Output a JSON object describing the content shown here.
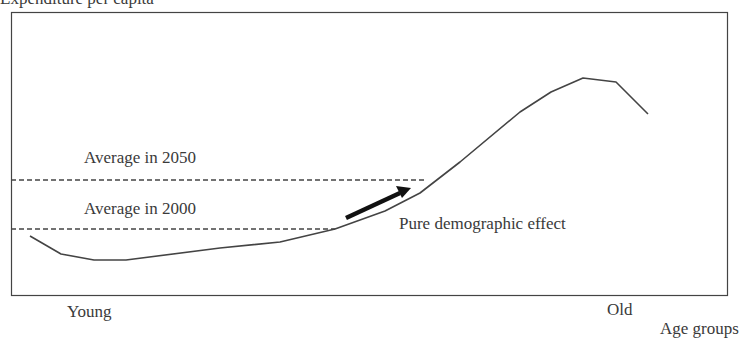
{
  "chart_data": {
    "type": "line",
    "title": "",
    "xlabel": "Age groups",
    "ylabel": "Expenditure per capita",
    "x_tick_labels": [
      "Young",
      "Old"
    ],
    "grid": false,
    "legend": null,
    "series": [
      {
        "name": "Expenditure profile by age",
        "points_px": [
          [
            30,
            236
          ],
          [
            61,
            254
          ],
          [
            94,
            260
          ],
          [
            126,
            260
          ],
          [
            220,
            248
          ],
          [
            280,
            242
          ],
          [
            335,
            229
          ],
          [
            385,
            211
          ],
          [
            420,
            193
          ],
          [
            460,
            162
          ],
          [
            520,
            112
          ],
          [
            551,
            92
          ],
          [
            583,
            78
          ],
          [
            616,
            82
          ],
          [
            648,
            114
          ]
        ]
      }
    ],
    "reference_lines": [
      {
        "label": "Average in 2050",
        "style": "dashed",
        "y_px": 180,
        "x_end_px": 427
      },
      {
        "label": "Average in 2000",
        "style": "dashed",
        "y_px": 229,
        "x_end_px": 335
      }
    ],
    "annotations": [
      {
        "text": "Pure demographic effect",
        "arrow": {
          "from_px": [
            346,
            218
          ],
          "to_px": [
            411,
            188
          ]
        }
      }
    ],
    "plot_box_px": {
      "left": 11,
      "top": 12,
      "right": 728,
      "bottom": 296
    }
  },
  "labels": {
    "ylabel": "Expenditure per capita",
    "xlabel": "Age groups",
    "young": "Young",
    "old": "Old",
    "avg2050": "Average in 2050",
    "avg2000": "Average in 2000",
    "pure": "Pure demographic effect"
  }
}
